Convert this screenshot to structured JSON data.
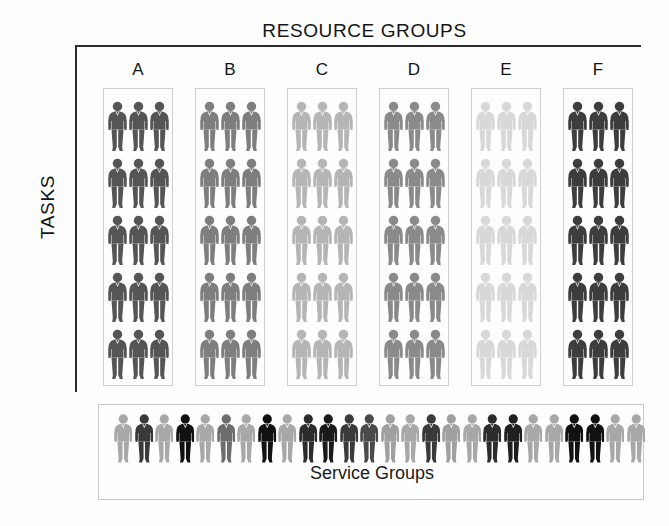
{
  "diagram": {
    "top_title": "RESOURCE GROUPS",
    "side_title": "TASKS",
    "service_label": "Service Groups",
    "columns": [
      {
        "letter": "A",
        "color": "#555555",
        "rows": 5,
        "per_row": 3
      },
      {
        "letter": "B",
        "color": "#7e7e7e",
        "rows": 5,
        "per_row": 3
      },
      {
        "letter": "C",
        "color": "#b5b5b5",
        "rows": 5,
        "per_row": 3
      },
      {
        "letter": "D",
        "color": "#8a8a8a",
        "rows": 5,
        "per_row": 3
      },
      {
        "letter": "E",
        "color": "#d8d8d8",
        "rows": 5,
        "per_row": 3
      },
      {
        "letter": "F",
        "color": "#3d3d3d",
        "rows": 5,
        "per_row": 3
      }
    ],
    "service_group_figures": [
      "#a8a8a8",
      "#3a3a3a",
      "#a8a8a8",
      "#111111",
      "#a8a8a8",
      "#6d6d6d",
      "#a8a8a8",
      "#111111",
      "#a8a8a8",
      "#2c2c2c",
      "#1a1a1a",
      "#3a3a3a",
      "#4a4a4a",
      "#a0a0a0",
      "#a8a8a8",
      "#3a3a3a",
      "#a0a0a0",
      "#a8a8a8",
      "#2c2c2c",
      "#1f1f1f",
      "#a8a8a8",
      "#a8a8a8",
      "#111111",
      "#111111",
      "#a8a8a8",
      "#a8a8a8"
    ],
    "palette": {
      "frame": "#2b2b2b",
      "box_border": "#cfcfcf",
      "text": "#141414",
      "background": "#fdfdfd"
    }
  }
}
